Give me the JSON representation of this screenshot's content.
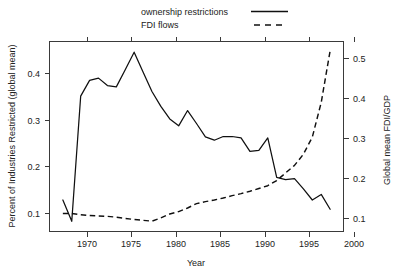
{
  "chart_data": {
    "type": "line",
    "title": "",
    "xlabel": "Year",
    "ylabel": "Percent of Industries Restricted (global mean)",
    "y2label": "Global mean FDI/GDP",
    "xlim": [
      1968.5,
      2001.5
    ],
    "ylim": [
      0.06,
      0.47
    ],
    "y2lim": [
      0.068,
      0.545
    ],
    "grid": false,
    "legend_position": "top-center",
    "xticks": [
      1970,
      1975,
      1980,
      1985,
      1990,
      1995,
      2000
    ],
    "xtick_labels": [
      "1970",
      "1975",
      "1980",
      "1985",
      "1990",
      "1995",
      "2000"
    ],
    "yticks": [
      0.1,
      0.2,
      0.3,
      0.4
    ],
    "ytick_labels": [
      "0.1",
      "0.2",
      "0.3",
      "0.4"
    ],
    "y2ticks": [
      0.1,
      0.2,
      0.3,
      0.4,
      0.5
    ],
    "y2tick_labels": [
      "0.1",
      "0.2",
      "0.3",
      "0.4",
      "0.5"
    ],
    "x": [
      1970,
      1971,
      1972,
      1973,
      1974,
      1975,
      1976,
      1977,
      1978,
      1979,
      1980,
      1981,
      1982,
      1983,
      1984,
      1985,
      1986,
      1987,
      1988,
      1989,
      1990,
      1991,
      1992,
      1993,
      1994,
      1995,
      1996,
      1997,
      1998,
      1999,
      2000
    ],
    "series": [
      {
        "name": "ownership restrictions",
        "style": "solid",
        "axis": "left",
        "color": "#101010",
        "values": [
          0.128,
          0.082,
          0.352,
          0.386,
          0.391,
          0.375,
          0.372,
          0.409,
          0.447,
          0.404,
          0.362,
          0.33,
          0.303,
          0.288,
          0.321,
          0.293,
          0.264,
          0.257,
          0.265,
          0.265,
          0.262,
          0.233,
          0.235,
          0.262,
          0.177,
          0.172,
          0.174,
          0.152,
          0.128,
          0.14,
          0.108
        ]
      },
      {
        "name": "FDI flows",
        "style": "dashed",
        "axis": "right",
        "color": "#101010",
        "values": [
          0.113,
          0.113,
          0.11,
          0.108,
          0.107,
          0.106,
          0.104,
          0.101,
          0.098,
          0.096,
          0.094,
          0.102,
          0.112,
          0.118,
          0.127,
          0.138,
          0.143,
          0.147,
          0.152,
          0.158,
          0.163,
          0.169,
          0.176,
          0.183,
          0.196,
          0.215,
          0.234,
          0.262,
          0.305,
          0.392,
          0.522
        ]
      }
    ],
    "legend": [
      {
        "label": "ownership restrictions",
        "style": "solid"
      },
      {
        "label": "FDI flows",
        "style": "dashed"
      }
    ]
  }
}
